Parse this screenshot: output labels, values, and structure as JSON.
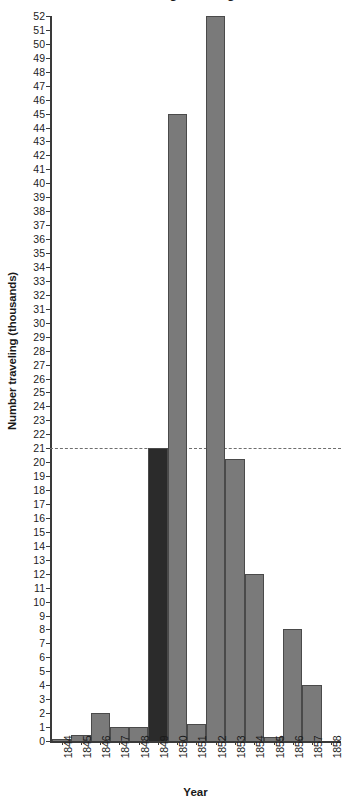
{
  "chart_data": {
    "type": "bar",
    "title": "who walked along the Oregon Trail",
    "title_lines": [
      "who walked along the Oregon Trail"
    ],
    "xlabel": "Year",
    "ylabel": "Number traveling (thousands)",
    "categories": [
      "1844",
      "1845",
      "1846",
      "1847",
      "1848",
      "1849",
      "1850",
      "1851",
      "1852",
      "1853",
      "1854",
      "1855",
      "1856",
      "1857",
      "1858"
    ],
    "values": [
      0.15,
      0.4,
      2,
      1,
      1,
      21,
      45,
      1.2,
      52,
      20.2,
      12,
      0.3,
      8,
      4,
      0
    ],
    "highlight_category": "1849",
    "highlight_value": 21,
    "ylim": [
      0,
      52
    ],
    "ytick_step": 1,
    "yticks": [
      52,
      51,
      50,
      49,
      48,
      47,
      46,
      45,
      44,
      43,
      42,
      41,
      40,
      39,
      38,
      37,
      36,
      35,
      34,
      33,
      32,
      31,
      30,
      29,
      28,
      27,
      26,
      25,
      24,
      23,
      22,
      21,
      20,
      19,
      18,
      17,
      16,
      15,
      14,
      13,
      12,
      11,
      10,
      9,
      8,
      7,
      6,
      5,
      4,
      3,
      2,
      1,
      0
    ],
    "grid": false,
    "legend": "none",
    "annotations": [
      {
        "type": "reference-line",
        "style": "dashed",
        "axis": "y",
        "value": 21,
        "label": "21"
      }
    ],
    "colors": {
      "bar": "#7a7a7a",
      "bar_highlight": "#2b2b2b",
      "bar_border": "#4a4a4a",
      "axis": "#3a3a3a",
      "reference_line": "#6e6e6e",
      "text": "#1a1a1a",
      "background": "#ffffff"
    }
  }
}
